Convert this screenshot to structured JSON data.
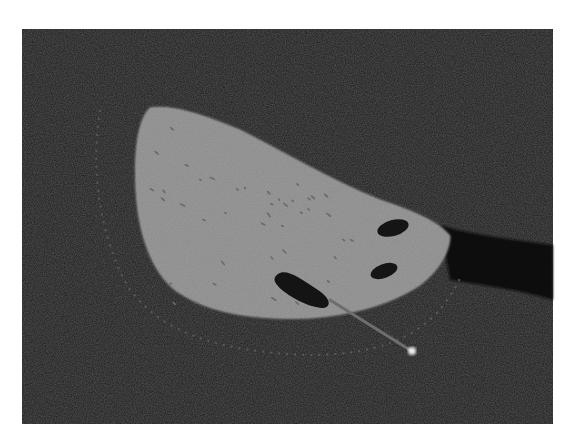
{
  "image": {
    "width": 573,
    "height": 441,
    "background": "#ffffff",
    "panel": {
      "x": 22,
      "y": 29,
      "width": 531,
      "height": 395,
      "color": "#1c1c1c"
    }
  },
  "specimen": {
    "fill": "#8a8a8a",
    "edge": "#9a9a9a",
    "path": "M150,108 C138,120 134,150 136,190 C138,230 150,270 175,290 C210,315 260,320 310,318 C350,315 390,305 420,285 C440,270 450,250 450,236 C440,222 410,210 380,200 C330,180 280,150 240,130 C210,118 175,104 150,108 Z",
    "holes": [
      {
        "cx": 393,
        "cy": 228,
        "rx": 16,
        "ry": 8,
        "rotate": -15,
        "color": "#151515"
      },
      {
        "cx": 384,
        "cy": 271,
        "rx": 14,
        "ry": 7,
        "rotate": -20,
        "color": "#151515"
      },
      {
        "path": "M278,274 C286,268 300,278 318,290 C330,298 332,306 324,308 C310,308 292,298 282,290 C274,283 272,278 278,274 Z",
        "color": "#141414"
      }
    ],
    "pores_color": "#6a6a6a"
  },
  "needle": {
    "x1": 330,
    "y1": 300,
    "x2": 410,
    "y2": 350,
    "color": "#6e6e6e",
    "tip": {
      "cx": 412,
      "cy": 351,
      "r": 4,
      "color": "#f0f0f0"
    }
  },
  "dotted_arc": {
    "color": "#5a5a5a",
    "path": "M100,110 C90,170 100,240 130,290 C165,335 220,350 300,355 C360,356 400,345 430,320 C445,305 455,290 460,278"
  },
  "shadow_region": {
    "path": "M440,225 C470,235 520,240 553,245 L553,300 C520,290 480,285 450,280 Z",
    "color": "#111111"
  }
}
